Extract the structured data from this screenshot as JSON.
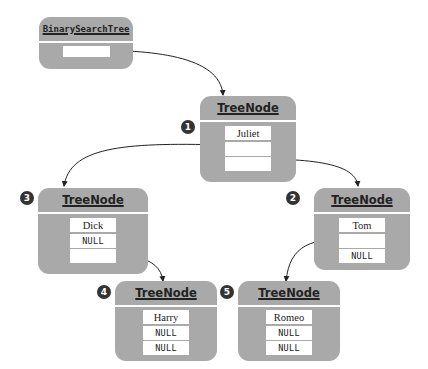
{
  "tree": {
    "root_label": "BinarySearchTree",
    "node_label": "TreeNode",
    "nodes": [
      {
        "badge": "1",
        "name": "Juliet",
        "left": "",
        "right": ""
      },
      {
        "badge": "2",
        "name": "Tom",
        "left": "",
        "right": "NULL"
      },
      {
        "badge": "3",
        "name": "Dick",
        "left": "NULL",
        "right": ""
      },
      {
        "badge": "4",
        "name": "Harry",
        "left": "NULL",
        "right": "NULL"
      },
      {
        "badge": "5",
        "name": "Romeo",
        "left": "NULL",
        "right": "NULL"
      }
    ]
  },
  "colors": {
    "node_fill": "#a9a9a9",
    "field_fill": "#ffffff",
    "badge_fill": "#333333",
    "line": "#222222"
  }
}
